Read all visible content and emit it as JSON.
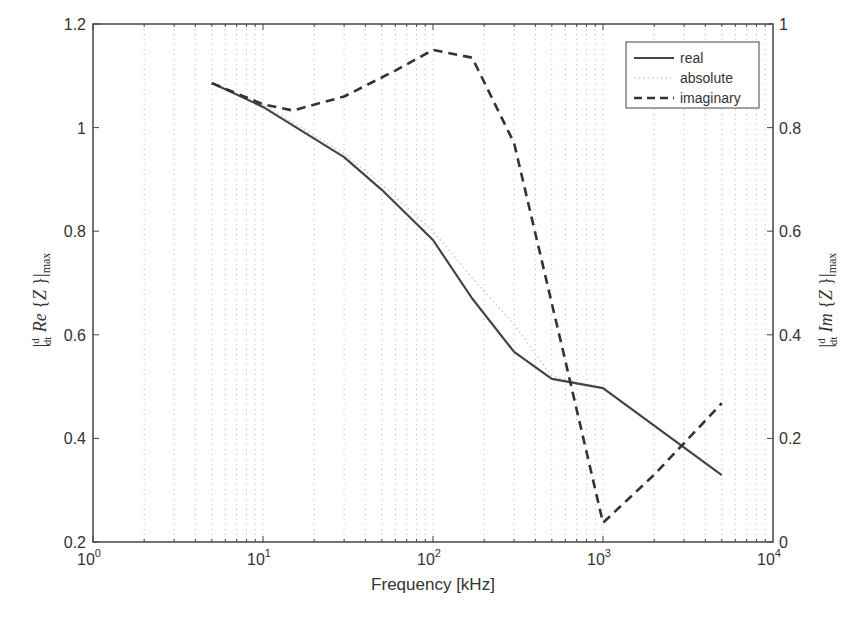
{
  "chart_data": {
    "type": "line",
    "title": "",
    "xlabel": "Frequency [kHz]",
    "ylabel_left": "|d/dt Re{Z}|max",
    "ylabel_right": "|d/dt Im{Z}|max",
    "xscale": "log",
    "xlim": [
      1,
      10000
    ],
    "ylim_left": [
      0.2,
      1.2
    ],
    "ylim_right": [
      0,
      1
    ],
    "grid": "x-minor-dotted",
    "x_ticks": [
      {
        "base": "10",
        "exp": "0",
        "value": 1
      },
      {
        "base": "10",
        "exp": "1",
        "value": 10
      },
      {
        "base": "10",
        "exp": "2",
        "value": 100
      },
      {
        "base": "10",
        "exp": "3",
        "value": 1000
      },
      {
        "base": "10",
        "exp": "4",
        "value": 10000
      }
    ],
    "y_ticks_left": [
      "0.2",
      "0.4",
      "0.6",
      "0.8",
      "1",
      "1.2"
    ],
    "y_ticks_right": [
      "0",
      "0.2",
      "0.4",
      "0.6",
      "0.8",
      "1"
    ],
    "legend": {
      "position": "top-right",
      "entries": [
        "real",
        "absolute",
        "imaginary"
      ]
    },
    "series": [
      {
        "name": "real",
        "axis": "left",
        "style": "solid",
        "color": "#444444",
        "x": [
          5,
          10,
          30,
          50,
          100,
          170,
          300,
          500,
          1000,
          5000
        ],
        "y": [
          1.086,
          1.04,
          0.943,
          0.88,
          0.783,
          0.67,
          0.567,
          0.515,
          0.497,
          0.329
        ]
      },
      {
        "name": "absolute",
        "axis": "left",
        "style": "dotted-faint",
        "color": "#cccccc",
        "x": [
          5,
          10,
          30,
          50,
          100,
          170,
          300,
          500,
          1000,
          5000
        ],
        "y": [
          1.086,
          1.045,
          0.95,
          0.89,
          0.8,
          0.71,
          0.62,
          0.52,
          0.497,
          0.329
        ]
      },
      {
        "name": "imaginary",
        "axis": "right",
        "style": "dashed",
        "color": "#333333",
        "x": [
          5,
          10,
          15,
          30,
          60,
          100,
          170,
          300,
          600,
          1000,
          2000,
          5000
        ],
        "y": [
          0.886,
          0.845,
          0.833,
          0.86,
          0.91,
          0.95,
          0.935,
          0.77,
          0.35,
          0.037,
          0.13,
          0.268
        ]
      }
    ]
  }
}
